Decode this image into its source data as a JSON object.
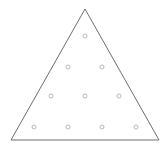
{
  "board": {
    "shape": "triangle",
    "stroke_color": "#6e6e6e",
    "hole_color": "#a8a8a8",
    "vertices": [
      [
        85,
        9
      ],
      [
        11,
        140
      ],
      [
        159,
        140
      ]
    ],
    "holes": [
      {
        "x": 85,
        "y": 36
      },
      {
        "x": 68,
        "y": 67
      },
      {
        "x": 102,
        "y": 67
      },
      {
        "x": 51,
        "y": 96
      },
      {
        "x": 85,
        "y": 96
      },
      {
        "x": 119,
        "y": 96
      },
      {
        "x": 34,
        "y": 127
      },
      {
        "x": 68,
        "y": 127
      },
      {
        "x": 102,
        "y": 127
      },
      {
        "x": 136,
        "y": 127
      }
    ]
  }
}
